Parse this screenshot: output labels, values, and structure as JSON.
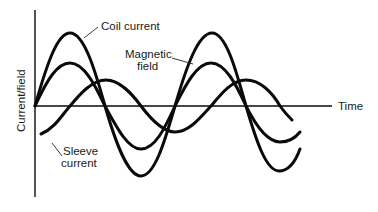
{
  "diagram": {
    "y_axis_label": "Current/field",
    "x_axis_label": "Time",
    "labels": {
      "coil_current": "Coil current",
      "magnetic_field_line1": "Magnetic",
      "magnetic_field_line2": "field",
      "sleeve_current_line1": "Sleeve",
      "sleeve_current_line2": "current"
    },
    "curves": [
      {
        "name": "Coil current",
        "relative_amplitude": 1.0,
        "phase": "reference"
      },
      {
        "name": "Magnetic field",
        "relative_amplitude": 0.6,
        "phase": "in phase with coil current"
      },
      {
        "name": "Sleeve current",
        "relative_amplitude": 0.4,
        "phase": "lags by ~90 degrees"
      }
    ],
    "colors": {
      "stroke": "#0a0a0a",
      "background": "#ffffff"
    }
  }
}
